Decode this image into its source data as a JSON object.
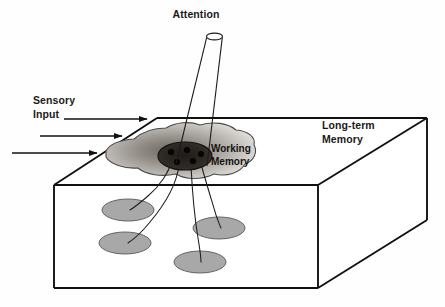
{
  "figure": {
    "background_color": "#fefefe",
    "line_color": "#111111",
    "ellipse_fill": "#a8a8a8",
    "focus_fill": "#2a2622"
  },
  "labels": {
    "attention": "Attention",
    "sensory_input_line1": "Sensory",
    "sensory_input_line2": "Input",
    "working_memory_line1": "Working",
    "working_memory_line2": "Memory",
    "long_term_line1": "Long-term",
    "long_term_line2": "Memory"
  },
  "arrows": [
    {
      "name": "sensory-arrow-1",
      "x1": 64,
      "y1": 119,
      "x2": 147,
      "y2": 119
    },
    {
      "name": "sensory-arrow-2",
      "x1": 40,
      "y1": 136,
      "x2": 122,
      "y2": 136
    },
    {
      "name": "sensory-arrow-3",
      "x1": 12,
      "y1": 153,
      "x2": 97,
      "y2": 153
    }
  ],
  "box": {
    "name": "long-term-memory-box",
    "top_back_left": [
      157,
      118
    ],
    "top_back_right": [
      427,
      118
    ],
    "top_front_right": [
      318,
      185
    ],
    "top_front_left": [
      54,
      185
    ],
    "bottom_front_left": [
      54,
      288
    ],
    "bottom_front_right": [
      318,
      288
    ],
    "bottom_back_right": [
      427,
      220
    ]
  },
  "attention_cone": {
    "name": "attention-cone",
    "top_ellipse": {
      "cx": 214.5,
      "cy": 36.5,
      "rx": 8.0,
      "ry": 3.4
    },
    "left_edge": [
      [
        206.6,
        37.6
      ],
      [
        176,
        164
      ]
    ],
    "right_edge": [
      [
        222.4,
        37.6
      ],
      [
        207,
        165
      ]
    ]
  },
  "working_memory_blob": {
    "name": "working-memory-blob",
    "path": "M 106,151 C 110,143 122,140 134,139 C 142,132 154,128 166,128 C 176,122 190,121 200,125 C 213,121 228,123 236,130 C 248,131 256,137 254,145 C 258,152 254,161 245,164 C 240,173 227,177 214,174 C 202,180 186,180 176,174 C 162,177 146,175 138,168 C 124,169 110,164 106,157 Z"
  },
  "focus_region": {
    "name": "attention-focus-region",
    "ellipse": {
      "cx": 185,
      "cy": 156,
      "rx": 27,
      "ry": 14
    },
    "dots": [
      {
        "cx": 171,
        "cy": 152,
        "r": 3.1
      },
      {
        "cx": 187,
        "cy": 150,
        "r": 3.1
      },
      {
        "cx": 201,
        "cy": 154,
        "r": 3.1
      },
      {
        "cx": 177,
        "cy": 162,
        "r": 3.1
      },
      {
        "cx": 193,
        "cy": 161,
        "r": 3.1
      }
    ]
  },
  "long_term_ellipses": [
    {
      "name": "memory-trace-1",
      "cx": 128,
      "cy": 210,
      "rx": 26,
      "ry": 11
    },
    {
      "name": "memory-trace-2",
      "cx": 125,
      "cy": 243,
      "rx": 26,
      "ry": 11
    },
    {
      "name": "memory-trace-3",
      "cx": 219,
      "cy": 228,
      "rx": 26,
      "ry": 11
    },
    {
      "name": "memory-trace-4",
      "cx": 200,
      "cy": 262,
      "rx": 26,
      "ry": 11
    }
  ],
  "connectors": [
    {
      "name": "connector-1",
      "path": "M 172,160 C 169,172 160,186 148,196 C 141,202 135,207 130,210"
    },
    {
      "name": "connector-2",
      "path": "M 179,165 C 177,182 166,203 150,222 C 142,232 134,239 128,243"
    },
    {
      "name": "connector-3",
      "path": "M 191,166 C 192,186 194,214 198,238 C 200,250 201,258 201,262"
    },
    {
      "name": "connector-4",
      "path": "M 200,160 C 204,176 211,198 216,215 C 219,223 220,226 221,228"
    }
  ]
}
